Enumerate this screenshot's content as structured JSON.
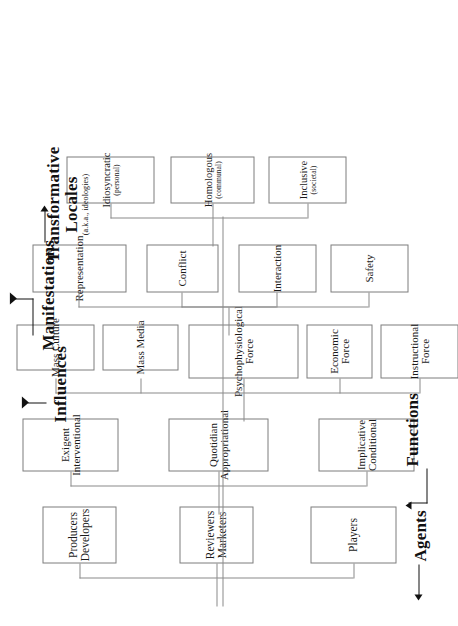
{
  "diagram": {
    "orientation": "rotated-90-ccw",
    "line_color": "#7d7d7d",
    "text_color": "#1a1a1a",
    "background": "#ffffff"
  },
  "groups": [
    {
      "id": "agents",
      "label": "Agents",
      "sublabel": "",
      "nodes": [
        {
          "line1": "Producers",
          "line2": "Developers",
          "sub": ""
        },
        {
          "line1": "Reviewers",
          "line2": "Marketers",
          "sub": ""
        },
        {
          "line1": "Players",
          "line2": "",
          "sub": ""
        }
      ]
    },
    {
      "id": "functions",
      "label": "Functions",
      "sublabel": "",
      "nodes": [
        {
          "line1": "Exigent",
          "line2": "Interventional",
          "sub": ""
        },
        {
          "line1": "Quotidian",
          "line2": "Appropriational",
          "sub": ""
        },
        {
          "line1": "Implicative",
          "line2": "Conditional",
          "sub": ""
        }
      ]
    },
    {
      "id": "influences",
      "label": "Influences",
      "sublabel": "",
      "nodes": [
        {
          "line1": "Mass Culture",
          "line2": "",
          "sub": ""
        },
        {
          "line1": "Mass Media",
          "line2": "",
          "sub": ""
        },
        {
          "line1": "Psychophysiological",
          "line2": "Force",
          "sub": ""
        },
        {
          "line1": "Economic",
          "line2": "Force",
          "sub": ""
        },
        {
          "line1": "Instructional",
          "line2": "Force",
          "sub": ""
        }
      ]
    },
    {
      "id": "manifestations",
      "label": "Manifestations",
      "sublabel": "",
      "nodes": [
        {
          "line1": "Representation",
          "line2": "",
          "sub": ""
        },
        {
          "line1": "Conflict",
          "line2": "",
          "sub": ""
        },
        {
          "line1": "Interaction",
          "line2": "",
          "sub": ""
        },
        {
          "line1": "Safety",
          "line2": "",
          "sub": ""
        }
      ]
    },
    {
      "id": "transformative-locales",
      "label1": "Transformative",
      "label2": "Locales",
      "sublabel": "(a.k.a., ideologies)",
      "nodes": [
        {
          "line1": "Idiosyncratic",
          "line2": "",
          "sub": "(personal)"
        },
        {
          "line1": "Homologous",
          "line2": "",
          "sub": "(communal)"
        },
        {
          "line1": "Inclusive",
          "line2": "",
          "sub": "(societal)"
        }
      ]
    }
  ]
}
